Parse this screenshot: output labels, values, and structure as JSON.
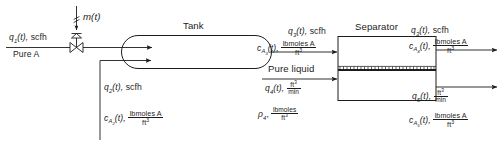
{
  "diagram": {
    "type": "process-flow-diagram",
    "nodes": {
      "tank": {
        "label": "Tank"
      },
      "separator": {
        "label": "Separator"
      }
    },
    "streams": {
      "feed_gas": {
        "flow": "q",
        "flow_sub": "1",
        "flow_time": "(t),",
        "flow_unit": "scfh",
        "purity": "Pure A"
      },
      "valve_signal": {
        "signal": "m",
        "signal_time": "(t)"
      },
      "recycle_gas": {
        "flow": "q",
        "flow_sub": "2",
        "flow_time": "(t),",
        "flow_unit": "scfh",
        "conc": "c",
        "conc_sub": "A",
        "conc_sub2": "2",
        "conc_time": "(t),",
        "conc_num": "lbmoles A",
        "conc_den": "ft"
      },
      "tank_outlet_gas": {
        "flow": "q",
        "flow_sub": "3",
        "flow_time": "(t),",
        "flow_unit": "scfh",
        "conc": "c",
        "conc_sub": "A",
        "conc_sub2": "3",
        "conc_time": "(t),",
        "conc_num": "lbmoles A",
        "conc_den": "ft"
      },
      "liquid_feed": {
        "title": "Pure liquid",
        "flow": "q",
        "flow_sub": "4",
        "flow_time": "(t),",
        "flow_num": "ft",
        "flow_den": "min",
        "density": "ρ",
        "density_sub": "4",
        "density_comma": ",",
        "density_num": "lbmoles",
        "density_den": "ft"
      },
      "separator_gas_outlet": {
        "flow": "q",
        "flow_sub": "3",
        "flow_time": "(t),",
        "flow_unit": "scfh",
        "conc": "c",
        "conc_sub": "A",
        "conc_sub2": "4",
        "conc_time": "(t),",
        "conc_num": "lbmoles A",
        "conc_den": "ft"
      },
      "separator_liquid_outlet": {
        "flow": "q",
        "flow_sub": "5",
        "flow_time": "(t),",
        "flow_num": "ft",
        "flow_den": "min",
        "conc": "c",
        "conc_sub": "A",
        "conc_sub2": "5",
        "conc_time": "(t),",
        "conc_num": "lbmoles A",
        "conc_den": "ft"
      }
    },
    "exponents": {
      "cubed": "3"
    },
    "colors": {
      "line": "#1c1c1c",
      "text": "#1c1c1c",
      "background": "#ffffff"
    }
  }
}
